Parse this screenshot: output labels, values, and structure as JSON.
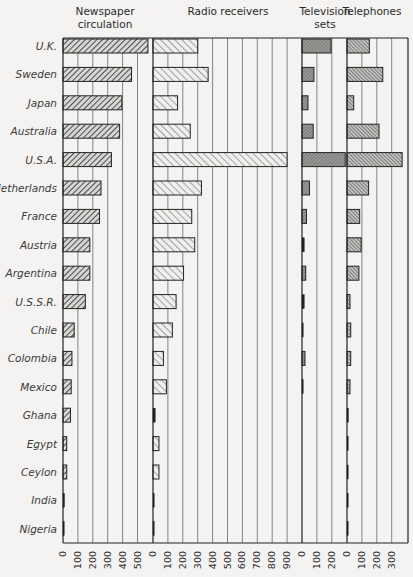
{
  "chart_data": {
    "type": "bar",
    "orientation": "horizontal",
    "title": "",
    "categories": [
      "U.K.",
      "Sweden",
      "Japan",
      "Australia",
      "U.S.A.",
      "Netherlands",
      "France",
      "Austria",
      "Argentina",
      "U.S.S.R.",
      "Chile",
      "Colombia",
      "Mexico",
      "Ghana",
      "Egypt",
      "Ceylon",
      "India",
      "Nigeria"
    ],
    "panels": [
      {
        "name": "Newspaper circulation",
        "title_lines": [
          "Newspaper",
          "circulation"
        ],
        "xlim": [
          0,
          570
        ],
        "ticks": [
          "0",
          "100",
          "200",
          "300",
          "400",
          "500"
        ],
        "pattern": "dense-forward",
        "values": [
          570,
          460,
          395,
          380,
          325,
          255,
          245,
          180,
          180,
          150,
          75,
          60,
          55,
          50,
          25,
          25,
          10,
          8
        ]
      },
      {
        "name": "Radio receivers",
        "title_lines": [
          "Radio receivers"
        ],
        "xlim": [
          0,
          1000
        ],
        "ticks": [
          "0",
          "100",
          "200",
          "300",
          "400",
          "500",
          "600",
          "700",
          "800",
          "900"
        ],
        "pattern": "sparse-backward",
        "values": [
          300,
          370,
          165,
          250,
          900,
          325,
          260,
          280,
          205,
          155,
          130,
          70,
          90,
          15,
          40,
          40,
          5,
          2
        ]
      },
      {
        "name": "Television sets",
        "title_lines": [
          "Television",
          "sets"
        ],
        "xlim": [
          0,
          300
        ],
        "ticks": [
          "0",
          "100",
          "200"
        ],
        "pattern": "crosshatch",
        "values": [
          195,
          80,
          40,
          75,
          290,
          50,
          30,
          15,
          25,
          15,
          2,
          20,
          5,
          0,
          0,
          0,
          0,
          0
        ]
      },
      {
        "name": "Telephones",
        "title_lines": [
          "Telephones"
        ],
        "xlim": [
          0,
          400
        ],
        "ticks": [
          "0",
          "100",
          "200",
          "300"
        ],
        "pattern": "fine-backward",
        "values": [
          150,
          240,
          45,
          215,
          370,
          145,
          85,
          95,
          80,
          20,
          25,
          25,
          20,
          10,
          5,
          3,
          3,
          2
        ]
      }
    ],
    "grid": true,
    "legend": "none",
    "xlabel": "",
    "ylabel": ""
  }
}
